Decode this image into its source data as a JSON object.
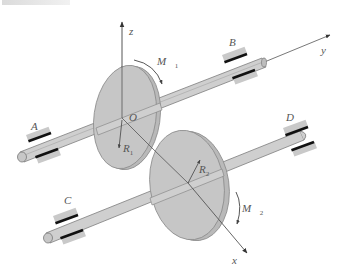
{
  "figure": {
    "colors": {
      "disk_fill": "#c4c4c4",
      "disk_edge": "#8a8a8a",
      "shaft_fill": "#cfcfcf",
      "bearing_light": "#c9c9c9",
      "bearing_dark": "#111111",
      "axis": "#444444",
      "text": "#555555"
    },
    "axes": {
      "x": "x",
      "y": "y",
      "z": "z",
      "origin": "O"
    },
    "bearings": {
      "a": "A",
      "b": "B",
      "c": "C",
      "d": "D"
    },
    "radii": {
      "r1": {
        "base": "R",
        "sub": "1"
      },
      "r2": {
        "base": "R",
        "sub": "2"
      }
    },
    "moments": {
      "m1": {
        "base": "M⃗",
        "sub": "1"
      },
      "m2": {
        "base": "M⃗",
        "sub": "2"
      }
    }
  }
}
